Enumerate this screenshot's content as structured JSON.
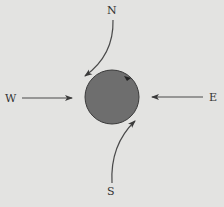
{
  "diagram": {
    "labels": {
      "north": "N",
      "south": "S",
      "east": "E",
      "west": "W"
    },
    "center_body": {
      "shape": "circle",
      "fill": "#6e6e6e",
      "stroke": "#3a3a3a",
      "rotation": "counter-clockwise"
    },
    "arrows": [
      {
        "from": "N",
        "to": "center",
        "style": "curved"
      },
      {
        "from": "S",
        "to": "center",
        "style": "curved"
      },
      {
        "from": "W",
        "to": "center",
        "style": "straight"
      },
      {
        "from": "E",
        "to": "center",
        "style": "straight"
      }
    ],
    "colors": {
      "background": "#e3e3e1",
      "line": "#4a4a4a"
    }
  }
}
